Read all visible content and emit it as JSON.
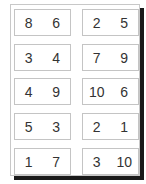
{
  "cards": [
    {
      "a": "8",
      "b": "6"
    },
    {
      "a": "2",
      "b": "5"
    },
    {
      "a": "3",
      "b": "4"
    },
    {
      "a": "7",
      "b": "9"
    },
    {
      "a": "4",
      "b": "9"
    },
    {
      "a": "10",
      "b": "6"
    },
    {
      "a": "5",
      "b": "3"
    },
    {
      "a": "2",
      "b": "1"
    },
    {
      "a": "1",
      "b": "7"
    },
    {
      "a": "3",
      "b": "10"
    }
  ]
}
